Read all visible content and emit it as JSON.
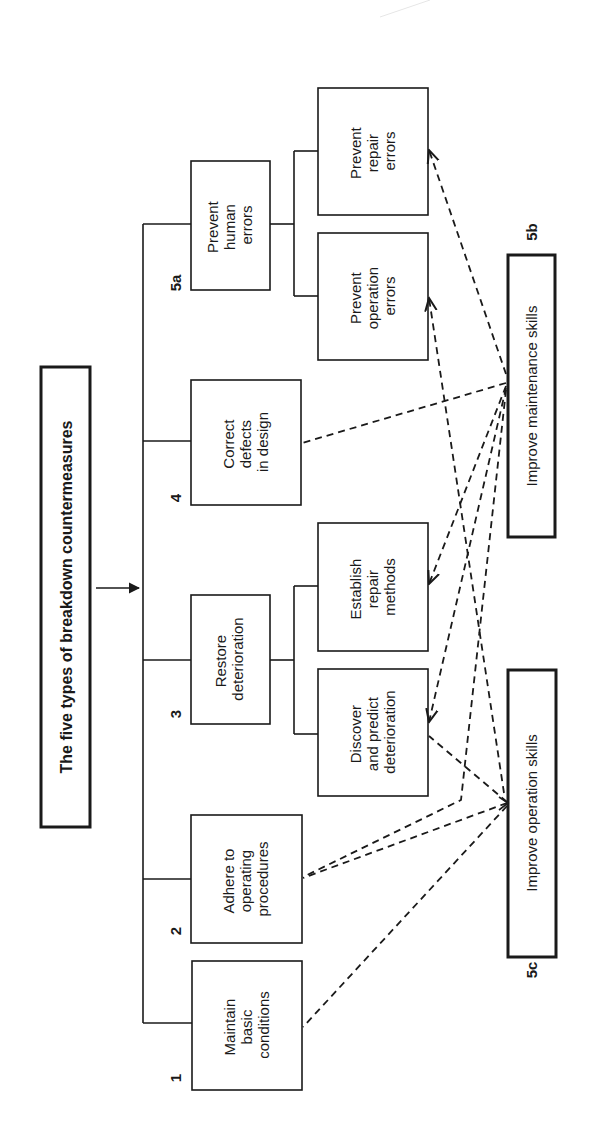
{
  "diagram": {
    "orientation": "rotated 90 degrees counterclockwise",
    "title": "The five types of breakdown countermeasures",
    "colors": {
      "ink": "#1a1a1a",
      "background": "#ffffff"
    },
    "categories": [
      {
        "number": "1",
        "lines": [
          "Maintain",
          "basic",
          "conditions"
        ]
      },
      {
        "number": "2",
        "lines": [
          "Adhere to",
          "operating",
          "procedures"
        ]
      },
      {
        "number": "3",
        "lines": [
          "Restore",
          "deterioration"
        ],
        "children": [
          {
            "lines": [
              "Discover",
              "and predict",
              "deterioration"
            ]
          },
          {
            "lines": [
              "Establish",
              "repair",
              "methods"
            ]
          }
        ]
      },
      {
        "number": "4",
        "lines": [
          "Correct",
          "defects",
          "in design"
        ]
      },
      {
        "number": "5a",
        "lines": [
          "Prevent",
          "human",
          "errors"
        ],
        "children": [
          {
            "lines": [
              "Prevent",
              "operation",
              "errors"
            ]
          },
          {
            "lines": [
              "Prevent",
              "repair",
              "errors"
            ]
          }
        ]
      }
    ],
    "skills": [
      {
        "number": "5b",
        "label": "Improve maintenance skills"
      },
      {
        "number": "5c",
        "label": "Improve operation skills"
      }
    ],
    "links": [
      {
        "from": "Improve maintenance skills",
        "to": "Prevent repair errors"
      },
      {
        "from": "Improve maintenance skills",
        "to": "Correct defects in design"
      },
      {
        "from": "Improve maintenance skills",
        "to": "Establish repair methods"
      },
      {
        "from": "Improve maintenance skills",
        "to": "Discover and predict deterioration"
      },
      {
        "from": "Improve maintenance skills",
        "to": "Adhere to operating procedures"
      },
      {
        "from": "Improve operation skills",
        "to": "Prevent operation errors"
      },
      {
        "from": "Improve operation skills",
        "to": "Discover and predict deterioration"
      },
      {
        "from": "Improve operation skills",
        "to": "Adhere to operating procedures"
      },
      {
        "from": "Improve operation skills",
        "to": "Maintain basic conditions"
      }
    ]
  }
}
